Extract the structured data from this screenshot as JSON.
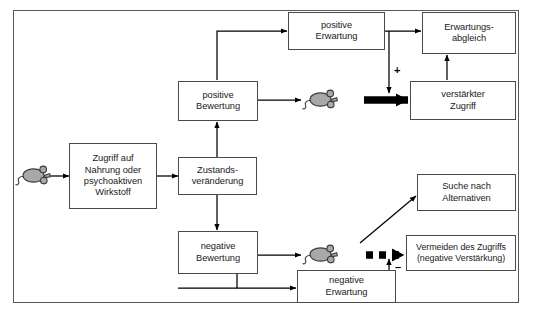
{
  "figure": {
    "frame_color": "#58585a",
    "box_border_color": "#4a4a4c",
    "text_color": "#1b1b1b",
    "mouse_fill_color": "#a8a8a8",
    "mouse_outline_color": "#3a3a3a",
    "arrow_color": "#000000"
  },
  "nodes": {
    "access": {
      "label": "Zugriff auf\nNahrung oder\npsychoaktiven\nWirkstoff"
    },
    "state_change": {
      "label": "Zustands-\nveränderung"
    },
    "positive_appraisal": {
      "label": "positive\nBewertung"
    },
    "positive_expectation": {
      "label": "positive\nErwartung"
    },
    "expectation_match": {
      "label": "Erwartungs-\nabgleich"
    },
    "increased_access": {
      "label": "verstärkter\nZugriff"
    },
    "negative_appraisal": {
      "label": "negative\nBewertung"
    },
    "negative_expectation": {
      "label": "negative\nErwartung"
    },
    "search_alternatives": {
      "label": "Suche nach\nAlternativen"
    },
    "avoid_access": {
      "label": "Vermeiden des Zugriffs\n(negative Verstärkung)"
    }
  },
  "signs": {
    "plus": "+",
    "minus": "–"
  },
  "actors": {
    "mouse_left": {
      "name": "mouse-left"
    },
    "mouse_top": {
      "name": "mouse-top"
    },
    "mouse_bottom": {
      "name": "mouse-bottom"
    }
  }
}
